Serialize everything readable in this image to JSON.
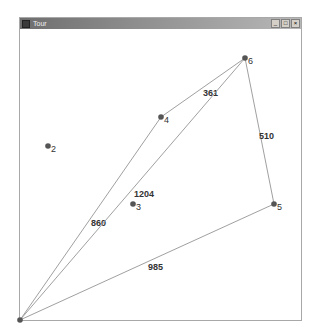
{
  "window": {
    "title": "Tour",
    "controls": {
      "minimize": "_",
      "maximize": "□",
      "close": "×"
    }
  },
  "graph": {
    "nodes": [
      {
        "id": "1",
        "x": 20,
        "y": 320,
        "label": ""
      },
      {
        "id": "2",
        "x": 48,
        "y": 146,
        "label": "2"
      },
      {
        "id": "3",
        "x": 133,
        "y": 204,
        "label": "3"
      },
      {
        "id": "4",
        "x": 161,
        "y": 117,
        "label": "4"
      },
      {
        "id": "5",
        "x": 274,
        "y": 204,
        "label": "5"
      },
      {
        "id": "6",
        "x": 245,
        "y": 58,
        "label": "6"
      }
    ],
    "edges": [
      {
        "from": "1",
        "to": "4",
        "weight": "860",
        "lx": 91,
        "ly": 226
      },
      {
        "from": "4",
        "to": "6",
        "weight": "361",
        "lx": 203,
        "ly": 96
      },
      {
        "from": "1",
        "to": "6",
        "weight": "1204",
        "lx": 134,
        "ly": 197
      },
      {
        "from": "6",
        "to": "5",
        "weight": "510",
        "lx": 259,
        "ly": 139
      },
      {
        "from": "5",
        "to": "1",
        "weight": "985",
        "lx": 148,
        "ly": 270
      }
    ]
  },
  "colors": {
    "edge": "#a0a0a0",
    "node": "#555555",
    "text": "#333333"
  }
}
